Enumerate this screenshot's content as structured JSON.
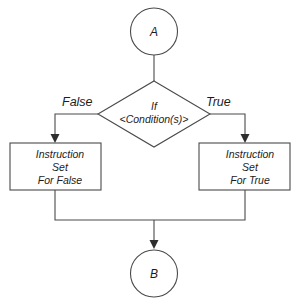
{
  "diagram": {
    "type": "flowchart",
    "background_color": "#ffffff",
    "stroke_color": "#4a4a4a",
    "text_color": "#1c1c1c",
    "nodes": {
      "start_connector": {
        "shape": "circle",
        "label": "A"
      },
      "decision": {
        "shape": "diamond",
        "line1": "If",
        "line2": "<Condition(s)>"
      },
      "false_branch": {
        "shape": "rectangle",
        "line1": "Instruction",
        "line2": "Set",
        "line3": "For False"
      },
      "true_branch": {
        "shape": "rectangle",
        "line1": "Instruction",
        "line2": "Set",
        "line3": "For True"
      },
      "end_connector": {
        "shape": "circle",
        "label": "B"
      }
    },
    "edges": {
      "false_label": "False",
      "true_label": "True"
    }
  }
}
